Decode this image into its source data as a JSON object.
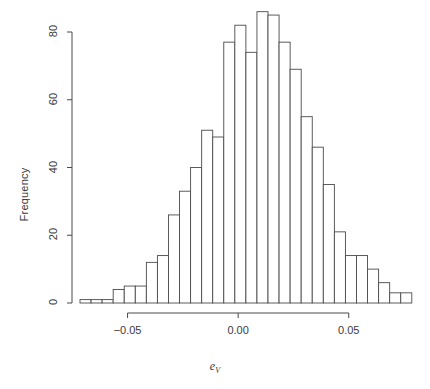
{
  "chart_data": {
    "type": "bar",
    "title": "",
    "subtitle": "",
    "xlabel": "e_V",
    "xlabel_base": "e",
    "xlabel_sub": "V",
    "ylabel": "Frequency",
    "xlim": [
      -0.0715,
      0.0795
    ],
    "ylim": [
      0,
      88
    ],
    "xticks": [
      -0.05,
      0.0,
      0.05
    ],
    "xtick_labels": [
      "-0.05",
      "0.00",
      "0.05"
    ],
    "yticks": [
      0,
      20,
      40,
      60,
      80
    ],
    "ytick_labels": [
      "0",
      "20",
      "40",
      "60",
      "80"
    ],
    "grid": false,
    "legend": "none",
    "bin_width": 0.005,
    "bin_edges": [
      -0.0715,
      -0.0665,
      -0.0615,
      -0.0565,
      -0.0515,
      -0.0465,
      -0.0415,
      -0.0365,
      -0.0315,
      -0.0265,
      -0.0215,
      -0.0165,
      -0.0115,
      -0.0065,
      -0.0015,
      0.0035,
      0.0085,
      0.0135,
      0.0185,
      0.0235,
      0.0285,
      0.0335,
      0.0385,
      0.0435,
      0.0485,
      0.0535,
      0.0585,
      0.0635,
      0.0685,
      0.0735,
      0.0785
    ],
    "categories": [
      "-0.0690",
      "-0.0640",
      "-0.0590",
      "-0.0540",
      "-0.0490",
      "-0.0440",
      "-0.0390",
      "-0.0340",
      "-0.0290",
      "-0.0240",
      "-0.0190",
      "-0.0140",
      "-0.0090",
      "-0.0040",
      "0.0010",
      "0.0060",
      "0.0110",
      "0.0160",
      "0.0210",
      "0.0260",
      "0.0310",
      "0.0360",
      "0.0410",
      "0.0460",
      "0.0510",
      "0.0560",
      "0.0610",
      "0.0660",
      "0.0710",
      "0.0760"
    ],
    "values": [
      1,
      1,
      1,
      4,
      5,
      5,
      12,
      14,
      26,
      33,
      40,
      51,
      49,
      77,
      82,
      74,
      86,
      85,
      77,
      69,
      55,
      46,
      35,
      21,
      14,
      14,
      10,
      6,
      3,
      3
    ],
    "bar_fill": "#ffffff",
    "bar_stroke": "#4a4a4a",
    "axis_color": "#4a4a4a",
    "text_color": "#3a3a3a",
    "background": "#ffffff"
  },
  "figure": {
    "plot_left": 80,
    "plot_right": 414,
    "baseline_y": 303,
    "top_y": 32
  }
}
